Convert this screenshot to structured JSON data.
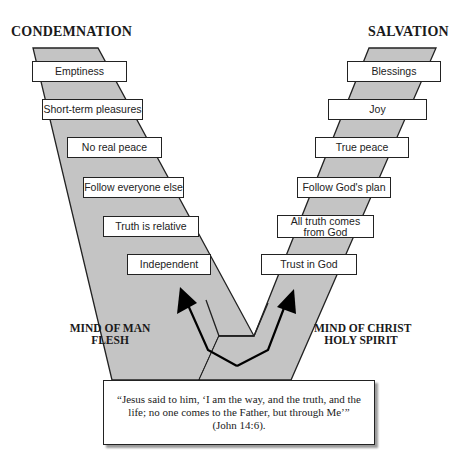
{
  "headings": {
    "left": "CONDEMNATION",
    "right": "SALVATION"
  },
  "left_path": {
    "label_line1": "MIND OF MAN",
    "label_line2": "FLESH",
    "steps": [
      "Emptiness",
      "Short-term pleasures",
      "No real peace",
      "Follow everyone else",
      "Truth is relative",
      "Independent"
    ]
  },
  "right_path": {
    "label_line1": "MIND OF CHRIST",
    "label_line2": "HOLY SPIRIT",
    "steps": [
      "Blessings",
      "Joy",
      "True peace",
      "Follow God's plan",
      "All truth comes\nfrom God",
      "Trust in God"
    ]
  },
  "quote": {
    "line1": "“Jesus said to him, ‘I am the way, and the truth, and the",
    "line2": "life; no one comes to the Father, but through Me’”",
    "citation": "(John 14:6)."
  },
  "colors": {
    "band_fill": "#c4c4c4",
    "outline": "#222222",
    "arrow": "#000000"
  }
}
